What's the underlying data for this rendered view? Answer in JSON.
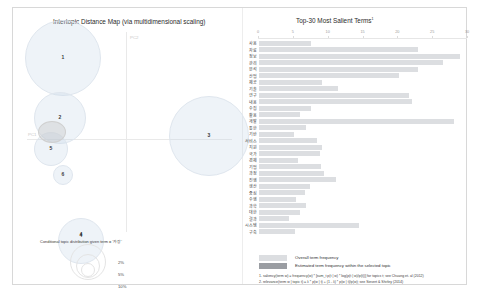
{
  "colors": {
    "topic_circle_fill": "#c8d7e8",
    "topic_circle_stroke": "#dfe6ee",
    "bar_overall": "#dcdee1",
    "bar_estimated": "#9a9da2",
    "axis": "#e6e6e6",
    "text": "#2b2b2b"
  },
  "left": {
    "title": "Intertopic Distance Map (via multidimensional scaling)",
    "axis_labels": {
      "pc1": "PC1",
      "pc2": "PC2"
    },
    "topics": [
      {
        "id": "1",
        "label": "1",
        "x": 50,
        "y": 50,
        "r": 38
      },
      {
        "id": "2",
        "label": "2",
        "x": 47,
        "y": 110,
        "r": 26
      },
      {
        "id": "3",
        "label": "3",
        "x": 196,
        "y": 128,
        "r": 40
      },
      {
        "id": "4",
        "label": "4",
        "x": 68,
        "y": 233,
        "r": 23
      },
      {
        "id": "5",
        "label": "5",
        "x": 38,
        "y": 141,
        "r": 17
      },
      {
        "id": "6",
        "label": "6",
        "x": 50,
        "y": 167,
        "r": 10
      }
    ],
    "slider": {
      "value_label": "4",
      "caption": "Conditional topic distribution given term = '가장'"
    },
    "marginal_legend": {
      "title": "Marginal topic distribution",
      "sizes": [
        "2%",
        "5%",
        "10%"
      ]
    }
  },
  "right": {
    "title": "Top-30 Most Salient Terms",
    "title_superscript": "1",
    "legend": {
      "overall": "Overall term frequency",
      "estimated": "Estimated term frequency within the selected topic"
    },
    "footnotes": [
      "1. saliency(term w) = frequency(w) * [sum_t p(t | w) * log(p(t | w)/p(t))] for topics t; see Chuang et. al (2012)",
      "2. relevance(term w | topic t) = λ * p(w | t) + (1 - λ) * p(w | t)/p(w); see Sievert & Shirley (2014)"
    ],
    "chart_data": {
      "type": "bar",
      "orientation": "horizontal",
      "title": "Top-30 Most Salient Terms",
      "xlabel": "",
      "ylabel": "",
      "xlim": [
        0,
        30
      ],
      "xticks": [
        0,
        5,
        10,
        15,
        20,
        25,
        30
      ],
      "grid": false,
      "legend_position": "bottom-left",
      "categories": [
        "사용",
        "자료",
        "정보",
        "관리",
        "분석",
        "산업",
        "제공",
        "기술",
        "연구",
        "내용",
        "수집",
        "활용",
        "개발",
        "통한",
        "기반",
        "서비스",
        "지원",
        "국가",
        "경제",
        "기업",
        "과정",
        "진행",
        "생산",
        "중심",
        "수행",
        "과학",
        "대한",
        "결과",
        "시스템",
        "구축"
      ],
      "series": [
        {
          "name": "Overall term frequency",
          "values": [
            7.5,
            23.0,
            29.2,
            26.6,
            23.1,
            20.3,
            9.1,
            11.5,
            21.8,
            22.2,
            7.5,
            6.0,
            28.2,
            6.8,
            5.1,
            8.4,
            9.2,
            8.9,
            5.6,
            9.0,
            9.4,
            11.1,
            7.4,
            6.6,
            5.3,
            6.8,
            5.9,
            4.4,
            14.5,
            5.2
          ]
        },
        {
          "name": "Estimated term frequency within the selected topic",
          "values": [
            0,
            0,
            0,
            0,
            0,
            0,
            0,
            0,
            0,
            0,
            0,
            0,
            0,
            0,
            0,
            0,
            0,
            0,
            0,
            0,
            0,
            0,
            0,
            0,
            0,
            0,
            0,
            0,
            0,
            0
          ]
        }
      ]
    }
  }
}
